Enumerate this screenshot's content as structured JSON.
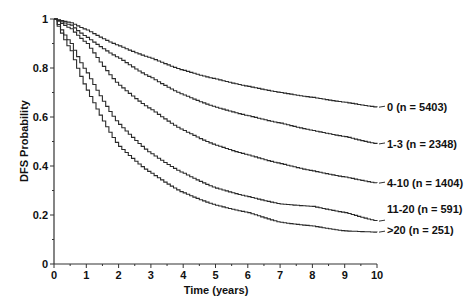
{
  "chart_data": {
    "type": "line",
    "title": "",
    "xlabel": "Time (years)",
    "ylabel": "DFS Probability",
    "xlim": [
      0,
      10
    ],
    "ylim": [
      0,
      1
    ],
    "grid": false,
    "legend_position": "inline-right",
    "x_ticks": [
      "0",
      "1",
      "2",
      "3",
      "4",
      "5",
      "6",
      "7",
      "8",
      "9",
      "10"
    ],
    "y_ticks": [
      "0",
      "0.2",
      "0.4",
      "0.6",
      "0.8",
      "1"
    ],
    "x": [
      0,
      0.5,
      1,
      2,
      3,
      4,
      5,
      6,
      7,
      8,
      9,
      10
    ],
    "series": [
      {
        "name": "0 (n = 5403)",
        "values": [
          1.0,
          0.985,
          0.955,
          0.89,
          0.84,
          0.79,
          0.755,
          0.725,
          0.7,
          0.68,
          0.66,
          0.64
        ]
      },
      {
        "name": "1-3 (n = 2348)",
        "values": [
          1.0,
          0.975,
          0.925,
          0.84,
          0.76,
          0.69,
          0.64,
          0.605,
          0.575,
          0.545,
          0.52,
          0.49
        ]
      },
      {
        "name": "4-10 (n = 1404)",
        "values": [
          1.0,
          0.96,
          0.9,
          0.73,
          0.63,
          0.545,
          0.485,
          0.445,
          0.41,
          0.38,
          0.355,
          0.33
        ]
      },
      {
        "name": "11-20 (n = 591)",
        "values": [
          1.0,
          0.9,
          0.78,
          0.57,
          0.45,
          0.37,
          0.31,
          0.275,
          0.245,
          0.235,
          0.21,
          0.175
        ]
      },
      {
        "name": ">20 (n = 251)",
        "values": [
          1.0,
          0.87,
          0.71,
          0.48,
          0.37,
          0.29,
          0.24,
          0.21,
          0.17,
          0.155,
          0.135,
          0.13
        ]
      }
    ]
  }
}
